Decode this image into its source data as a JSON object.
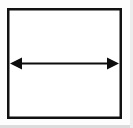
{
  "figure": {
    "canvas": {
      "width": 133,
      "height": 128,
      "background_color": "#fdfdfd"
    },
    "rectangle": {
      "name": "outer-rectangle",
      "x": 7,
      "y": 8,
      "width": 115,
      "height": 111,
      "stroke_color": "#111111",
      "stroke_width": 2.5,
      "fill_color": "#ffffff"
    },
    "arrow": {
      "name": "double-headed-arrow",
      "label": "",
      "orientation": "horizontal",
      "x_start": 10,
      "x_end": 119,
      "y": 63,
      "shaft_thickness": 2,
      "color": "#0d0d0d",
      "head_length": 12,
      "head_half_width": 6,
      "heads": "both"
    },
    "edge_shadow": {
      "name": "bottom-edge-shading",
      "color": "#d9d9d9"
    }
  }
}
